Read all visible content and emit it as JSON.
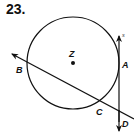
{
  "problem": {
    "number": "23."
  },
  "diagram": {
    "circle": {
      "center_label": "Z",
      "cx": 73,
      "cy": 63,
      "r": 46
    },
    "points": [
      {
        "label": "Z",
        "x": 73,
        "y": 63,
        "role": "center"
      },
      {
        "label": "A",
        "x": 119,
        "y": 63,
        "role": "point of tangency"
      },
      {
        "label": "B",
        "x": 27,
        "y": 62,
        "role": "intersection"
      },
      {
        "label": "C",
        "x": 100,
        "y": 101,
        "role": "intersection"
      },
      {
        "label": "D",
        "x": 119,
        "y": 112,
        "role": "intersection of lines"
      }
    ],
    "lines": [
      {
        "name": "s",
        "type": "tangent line",
        "through": [
          "A",
          "D"
        ]
      },
      {
        "name": "BD",
        "type": "secant",
        "through": [
          "B",
          "C",
          "D"
        ]
      }
    ]
  },
  "labels": {
    "Z": "Z",
    "A": "A",
    "B": "B",
    "C": "C",
    "D": "D",
    "s": "s"
  }
}
